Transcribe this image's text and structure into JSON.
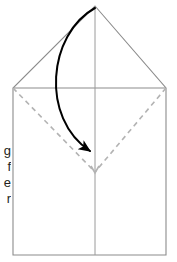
{
  "figure": {
    "kind": "origami-fold-diagram",
    "canvas": {
      "width": 177,
      "height": 262
    },
    "colors": {
      "solid_edge": "#8c8c8c",
      "dashed_fold": "#b3b3b3",
      "arrow": "#000000",
      "text": "#231f20",
      "background": "#ffffff"
    },
    "outline": {
      "name": "house-pentagon-outline",
      "points": "95,6 166,88 166,255 13,255 13,88",
      "apex": {
        "x": 95,
        "y": 6
      },
      "left_shoulder": {
        "x": 13,
        "y": 88
      },
      "right_shoulder": {
        "x": 166,
        "y": 88
      },
      "bottom_left": {
        "x": 13,
        "y": 255
      },
      "bottom_right": {
        "x": 166,
        "y": 255
      }
    },
    "horizontal_edge": {
      "name": "shoulder-line",
      "x1": 13,
      "y1": 88,
      "x2": 166,
      "y2": 88
    },
    "vertical_center_line": {
      "name": "center-crease",
      "x1": 95,
      "y1": 6,
      "x2": 95,
      "y2": 255
    },
    "dashed_folds": [
      {
        "name": "left-dashed-fold",
        "x1": 13,
        "y1": 88,
        "x2": 95,
        "y2": 172
      },
      {
        "name": "right-dashed-fold",
        "x1": 166,
        "y1": 88,
        "x2": 95,
        "y2": 172
      }
    ],
    "fold_arrow": {
      "name": "fold-down-arrow",
      "path": "M 95 8 C 48 34 40 118 92 152",
      "start": {
        "x": 95,
        "y": 8
      },
      "end": {
        "x": 95,
        "y": 156
      },
      "direction": "down-right",
      "head_size": 9
    }
  },
  "caption": {
    "name": "clipped-caption",
    "lines": [
      "g",
      "f",
      "e",
      "r"
    ]
  }
}
